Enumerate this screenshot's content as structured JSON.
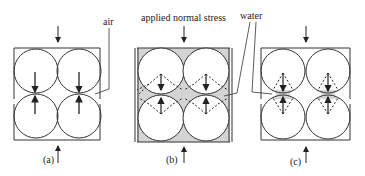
{
  "figure": {
    "labels": {
      "air": "air",
      "applied_normal_stress": "applied normal stress",
      "water": "water"
    },
    "panels": [
      {
        "id": "a",
        "caption": "(a)",
        "fluid": "air",
        "water_fill": "none"
      },
      {
        "id": "b",
        "caption": "(b)",
        "fluid": "water",
        "water_fill": "full"
      },
      {
        "id": "c",
        "caption": "(c)",
        "fluid": "water",
        "water_fill": "menisci"
      }
    ],
    "colors": {
      "stroke": "#333333",
      "water": "#d4d4d4",
      "background": "#ffffff"
    }
  }
}
